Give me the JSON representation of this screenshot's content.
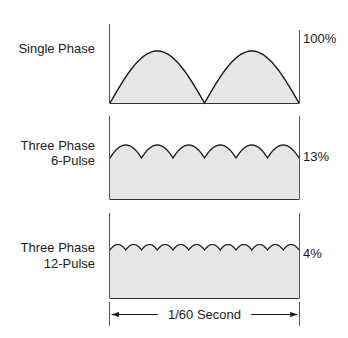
{
  "diagram": {
    "fill_color": "#e6e6e6",
    "line_color": "#1a1a1a",
    "frame_color": "#555555",
    "panels": [
      {
        "label_line1": "Single Phase",
        "label_line2": "",
        "ripple": "100%",
        "pulses": 2
      },
      {
        "label_line1": "Three Phase",
        "label_line2": "6-Pulse",
        "ripple": "13%",
        "pulses": 6
      },
      {
        "label_line1": "Three Phase",
        "label_line2": "12-Pulse",
        "ripple": "4%",
        "pulses": 12
      }
    ],
    "time_span_label": "1/60 Second"
  }
}
